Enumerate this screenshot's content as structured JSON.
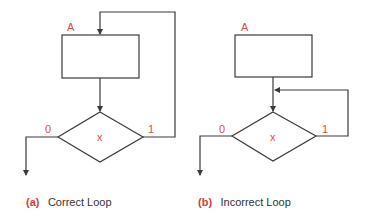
{
  "colors": {
    "stroke": "#3a3a3a",
    "label": "#e04a4a",
    "caption_tag": "#d23a3a",
    "caption_text": "#333333"
  },
  "panels": [
    {
      "id": "a",
      "box_label": "A",
      "decision_label": "x",
      "false_branch_label": "0",
      "true_branch_label": "1",
      "caption_tag": "(a)",
      "caption_text": "Correct Loop"
    },
    {
      "id": "b",
      "box_label": "A",
      "decision_label": "x",
      "false_branch_label": "0",
      "true_branch_label": "1",
      "caption_tag": "(b)",
      "caption_text": "Incorrect Loop"
    }
  ]
}
